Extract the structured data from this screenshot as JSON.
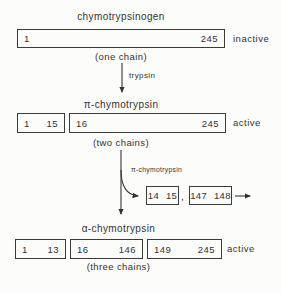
{
  "colors": {
    "ink": "#333333",
    "background": "#fcfcfa"
  },
  "stages": [
    {
      "title": "chymotrypsinogen",
      "state": "inactive",
      "chain_note": "(one chain)",
      "segments": [
        {
          "start": "1",
          "end": "245"
        }
      ]
    },
    {
      "title": "π-chymotrypsin",
      "state": "active",
      "chain_note": "(two chains)",
      "segments": [
        {
          "start": "1",
          "end": "15"
        },
        {
          "start": "16",
          "end": "245"
        }
      ]
    },
    {
      "title": "α-chymotrypsin",
      "state": "active",
      "chain_note": "(three chains)",
      "segments": [
        {
          "start": "1",
          "end": "13"
        },
        {
          "start": "16",
          "end": "146"
        },
        {
          "start": "149",
          "end": "245"
        }
      ]
    }
  ],
  "arrows": {
    "trypsin_label": "trypsin",
    "pi_label": "π-chymotrypsin"
  },
  "released_peptides": {
    "separator": ",",
    "boxes": [
      {
        "start": "14",
        "end": "15"
      },
      {
        "start": "147",
        "end": "148"
      }
    ]
  }
}
